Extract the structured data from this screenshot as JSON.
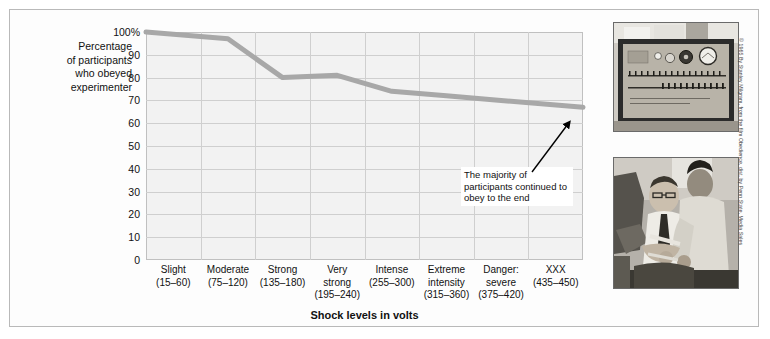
{
  "figure": {
    "y_caption": "Percentage\nof participants\nwho obeyed\nexperimenter",
    "annotation": "The majority of participants continued to obey to the end",
    "credit": "© 1965 By Stanley Milgram, from the film Obedience, dist. by Penn State, Media Sales",
    "photos": [
      {
        "name": "shock-generator-photo",
        "caption_alt": "Milgram shock generator control panel"
      },
      {
        "name": "learner-strapped-photo",
        "caption_alt": "Learner being strapped into chair by experimenter"
      }
    ]
  },
  "chart_data": {
    "type": "line",
    "title": "",
    "xlabel": "Shock levels in volts",
    "ylabel": "Percentage of participants who obeyed experimenter",
    "categories": [
      "Slight\n(15–60)",
      "Moderate\n(75–120)",
      "Strong\n(135–180)",
      "Very\nstrong\n(195–240)",
      "Intense\n(255–300)",
      "Extreme\nintensity\n(315–360)",
      "Danger:\nsevere\n(375–420)",
      "XXX\n(435–450)"
    ],
    "category_labels": [
      {
        "name": "Slight",
        "range": "(15–60)"
      },
      {
        "name": "Moderate",
        "range": "(75–120)"
      },
      {
        "name": "Strong",
        "range": "(135–180)"
      },
      {
        "name": "Very strong",
        "range": "(195–240)"
      },
      {
        "name": "Intense",
        "range": "(255–300)"
      },
      {
        "name": "Extreme intensity",
        "range": "(315–360)"
      },
      {
        "name": "Danger: severe",
        "range": "(375–420)"
      },
      {
        "name": "XXX",
        "range": "(435–450)"
      }
    ],
    "values": [
      100,
      97,
      80,
      81,
      74,
      72,
      70,
      67
    ],
    "ylim": [
      0,
      100
    ],
    "ytick_labels": [
      "100%",
      "90",
      "80",
      "70",
      "60",
      "50",
      "40",
      "30",
      "20",
      "10",
      "0"
    ],
    "ytick_values": [
      100,
      90,
      80,
      70,
      60,
      50,
      40,
      30,
      20,
      10,
      0
    ],
    "grid": true,
    "legend": "none",
    "line_color": "#a8a8a8",
    "plot_background": "#f2f2f2",
    "annotations": [
      {
        "text": "The majority of participants continued to obey to the end",
        "points_to_category": "XXX",
        "points_to_value": 67
      }
    ]
  }
}
